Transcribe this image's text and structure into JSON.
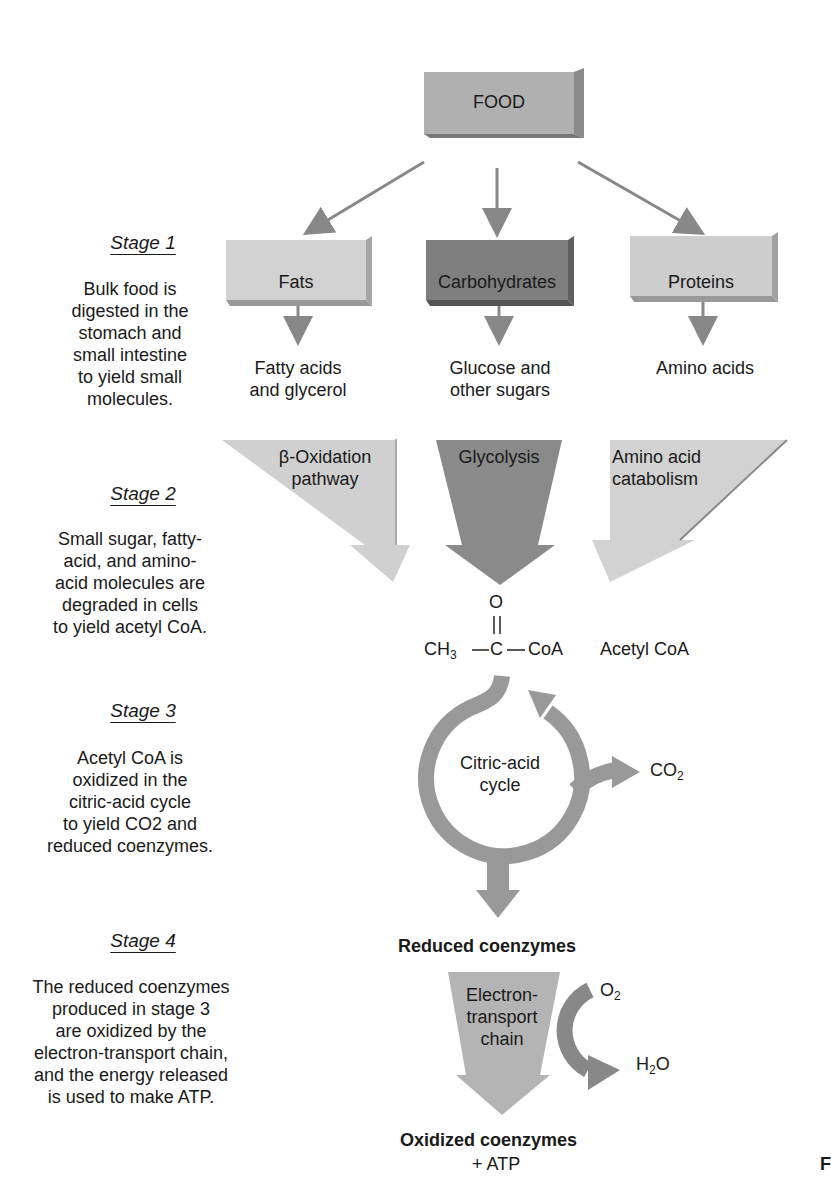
{
  "stages": [
    {
      "title": "Stage 1",
      "description": [
        "Bulk food is",
        "digested in the",
        "stomach and",
        "small intestine",
        "to yield small",
        "molecules."
      ]
    },
    {
      "title": "Stage 2",
      "description": [
        "Small sugar, fatty-",
        "acid, and amino-",
        "acid molecules are",
        "degraded in cells",
        "to yield acetyl CoA."
      ]
    },
    {
      "title": "Stage 3",
      "description": [
        "Acetyl CoA is",
        "oxidized in the",
        "citric-acid cycle",
        "to yield CO2 and",
        "reduced coenzymes."
      ]
    },
    {
      "title": "Stage 4",
      "description": [
        "The reduced coenzymes",
        "produced in stage 3",
        "are oxidized by the",
        "electron-transport chain,",
        "and the energy released",
        "is used to make ATP."
      ]
    }
  ],
  "nodes": {
    "food": "FOOD",
    "fats": "Fats",
    "carbohydrates": "Carbohydrates",
    "proteins": "Proteins",
    "fatty_acids": [
      "Fatty acids",
      "and glycerol"
    ],
    "glucose": [
      "Glucose and",
      "other sugars"
    ],
    "amino_acids": "Amino acids",
    "beta_oxidation": [
      "β-Oxidation",
      "pathway"
    ],
    "glycolysis": "Glycolysis",
    "amino_catabolism": [
      "Amino acid",
      "catabolism"
    ],
    "acetyl_formula": {
      "ch3": "CH",
      "sub3": "3",
      "c": "C",
      "o": "O",
      "coa": "CoA"
    },
    "acetyl_name": "Acetyl CoA",
    "citric_cycle": [
      "Citric-acid",
      "cycle"
    ],
    "co2": {
      "main": "CO",
      "sub": "2"
    },
    "reduced_coenzymes": "Reduced coenzymes",
    "etc": [
      "Electron-",
      "transport",
      "chain"
    ],
    "o2": {
      "main": "O",
      "sub": "2"
    },
    "h2o": {
      "h": "H",
      "sub": "2",
      "o": "O"
    },
    "oxidized_coenzymes": "Oxidized coenzymes",
    "plus_atp": "+ ATP",
    "edge_fragment": "F"
  },
  "colors": {
    "light_box": "#c8c8c8",
    "mid_box": "#a8a8a8",
    "dark_box": "#7a7a7a",
    "arrow": "#8a8a8a"
  }
}
